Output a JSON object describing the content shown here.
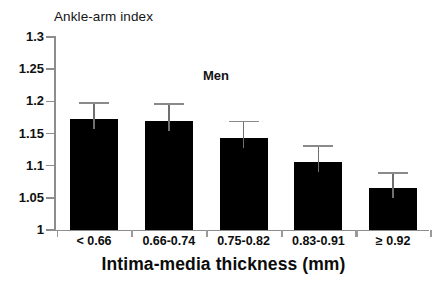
{
  "chart_data": {
    "type": "bar",
    "title": "",
    "ylabel": "Ankle-arm index",
    "xlabel": "Intima-media thickness (mm)",
    "annotation": "Men",
    "series_name": "Men",
    "categories": [
      "< 0.66",
      "0.66-0.74",
      "0.75-0.82",
      "0.83-0.91",
      "≥ 0.92"
    ],
    "values": [
      1.172,
      1.17,
      1.143,
      1.105,
      1.065
    ],
    "errors_upper": [
      1.199,
      1.197,
      1.17,
      1.132,
      1.09
    ],
    "error_half_widths": [
      0.027,
      0.027,
      0.027,
      0.027,
      0.025
    ],
    "ylim": [
      1.0,
      1.3
    ],
    "ytick_labels": [
      "1.3",
      "1.25",
      "1.2",
      "1.15",
      "1.1",
      "1.05",
      "1"
    ],
    "ytick_values": [
      1.3,
      1.25,
      1.2,
      1.15,
      1.1,
      1.05,
      1.0
    ],
    "grid": false,
    "legend": "none",
    "bar_color": "#000000",
    "error_bar_color": "#8a8a8a",
    "axis_color": "#8d8d8d",
    "background": "#ffffff",
    "error_bars_direction": "upper-only"
  }
}
